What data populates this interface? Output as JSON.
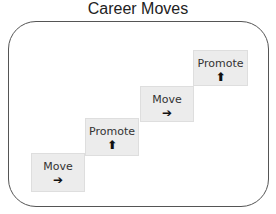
{
  "title": "Career Moves",
  "steps": [
    {
      "label": "Move",
      "icon": "➔",
      "icon_name": "arrow-right-icon"
    },
    {
      "label": "Promote",
      "icon": "🡅",
      "icon_name": "arrow-up-icon"
    },
    {
      "label": "Move",
      "icon": "➔",
      "icon_name": "arrow-right-icon"
    },
    {
      "label": "Promote",
      "icon": "🡅",
      "icon_name": "arrow-up-icon"
    }
  ],
  "colors": {
    "box_fill": "#ececec",
    "frame_border": "#555555"
  }
}
